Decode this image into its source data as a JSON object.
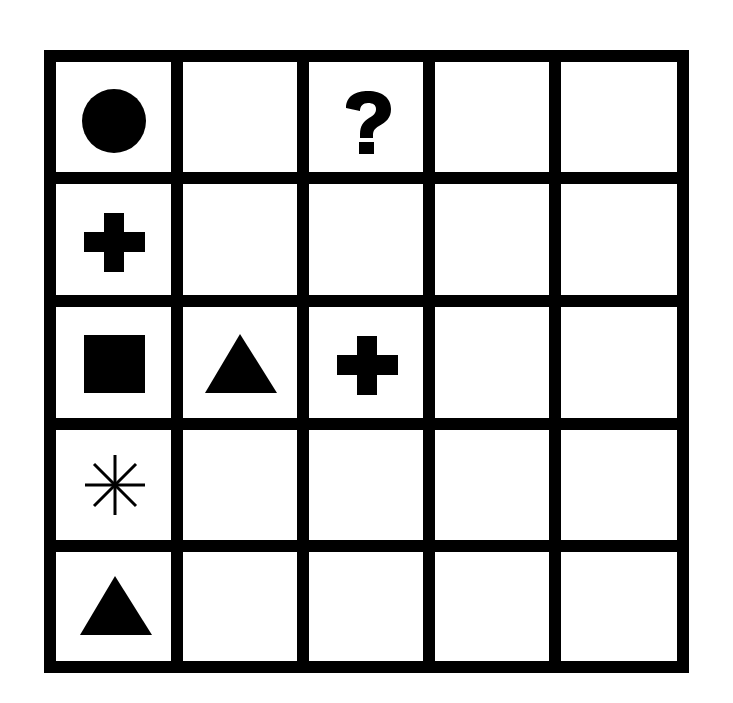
{
  "puzzle": {
    "type": "symbol-grid",
    "rows": 5,
    "cols": 5,
    "colors": {
      "line": "#000000",
      "background": "#ffffff",
      "symbol": "#000000"
    },
    "cells": [
      [
        "circle",
        "",
        "question-mark",
        "",
        ""
      ],
      [
        "plus",
        "",
        "",
        "",
        ""
      ],
      [
        "square",
        "triangle",
        "plus",
        "",
        ""
      ],
      [
        "asterisk",
        "",
        "",
        "",
        ""
      ],
      [
        "triangle",
        "",
        "",
        "",
        ""
      ]
    ],
    "question_mark_label": "?"
  }
}
